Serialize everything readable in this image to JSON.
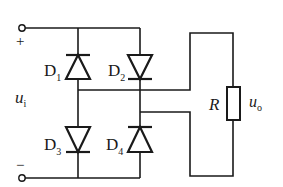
{
  "diagram": {
    "type": "bridge-rectifier-circuit",
    "input": {
      "voltage_label": "u",
      "voltage_subscript": "i",
      "plus_label": "+",
      "minus_label": "−"
    },
    "diodes": [
      {
        "label": "D",
        "subscript": "1"
      },
      {
        "label": "D",
        "subscript": "2"
      },
      {
        "label": "D",
        "subscript": "3"
      },
      {
        "label": "D",
        "subscript": "4"
      }
    ],
    "load": {
      "resistor_label": "R",
      "output_label": "u",
      "output_subscript": "o"
    },
    "colors": {
      "line": "#1a1a1a",
      "background": "#ffffff"
    }
  }
}
